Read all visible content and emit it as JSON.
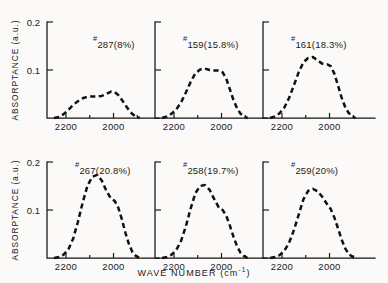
{
  "figure": {
    "background_color": "#fbfaf8",
    "curve_color": "#111111",
    "axis_color": "#141414",
    "axis_titles": {
      "y": "ABSORPTANCE (a.u.)",
      "x_main": "WAVE NUMBER (cm",
      "x_sup": "-1",
      "x_close": ")"
    },
    "y_ticks": [
      "0.2",
      "0.1"
    ],
    "x_ticks": [
      "2200",
      "2000"
    ]
  },
  "chart_data": {
    "type": "line",
    "title": "",
    "xlabel": "WAVE NUMBER (cm^-1)",
    "ylabel": "ABSORPTANCE (a.u.)",
    "xlim": [
      2280,
      1880
    ],
    "ylim": [
      0,
      0.2
    ],
    "x_tick_values": [
      2200,
      2000
    ],
    "y_tick_values": [
      0.1,
      0.2
    ],
    "x_axis_direction": "descending",
    "grid": false,
    "legend": "none",
    "line_style": "dashed",
    "panel_layout": {
      "rows": 2,
      "cols": 3
    },
    "panels": [
      {
        "id": "panel-287",
        "label": "#287(8%)",
        "sample": "287",
        "percent": "8%",
        "peak_absorptance": 0.055,
        "peak_wavenumber": 2000,
        "x": [
          2250,
          2230,
          2210,
          2190,
          2170,
          2150,
          2130,
          2110,
          2090,
          2070,
          2050,
          2030,
          2010,
          1995,
          1980,
          1965,
          1950,
          1935,
          1920,
          1905,
          1890
        ],
        "y": [
          0.0,
          0.002,
          0.008,
          0.017,
          0.027,
          0.035,
          0.041,
          0.044,
          0.045,
          0.045,
          0.046,
          0.05,
          0.055,
          0.054,
          0.048,
          0.038,
          0.027,
          0.016,
          0.008,
          0.003,
          0.0
        ]
      },
      {
        "id": "panel-159",
        "label": "#159(15.8%)",
        "sample": "159",
        "percent": "15.8%",
        "peak_absorptance": 0.103,
        "peak_wavenumber": 2070,
        "x": [
          2250,
          2230,
          2210,
          2190,
          2170,
          2150,
          2130,
          2110,
          2090,
          2070,
          2050,
          2030,
          2010,
          1995,
          1980,
          1965,
          1950,
          1935,
          1920,
          1905,
          1890
        ],
        "y": [
          0.0,
          0.003,
          0.009,
          0.018,
          0.033,
          0.053,
          0.075,
          0.093,
          0.101,
          0.103,
          0.1,
          0.099,
          0.099,
          0.095,
          0.082,
          0.06,
          0.038,
          0.021,
          0.009,
          0.003,
          0.0
        ]
      },
      {
        "id": "panel-161",
        "label": "#161(18.3%)",
        "sample": "161",
        "percent": "18.3%",
        "peak_absorptance": 0.127,
        "peak_wavenumber": 2065,
        "x": [
          2250,
          2230,
          2210,
          2190,
          2170,
          2150,
          2130,
          2110,
          2090,
          2070,
          2050,
          2030,
          2010,
          1995,
          1980,
          1965,
          1950,
          1935,
          1920,
          1905,
          1890
        ],
        "y": [
          0.0,
          0.003,
          0.01,
          0.022,
          0.042,
          0.068,
          0.095,
          0.116,
          0.125,
          0.127,
          0.12,
          0.113,
          0.112,
          0.108,
          0.093,
          0.069,
          0.044,
          0.024,
          0.011,
          0.004,
          0.0
        ]
      },
      {
        "id": "panel-267",
        "label": "#267(20.8%)",
        "sample": "267",
        "percent": "20.8%",
        "peak_absorptance": 0.173,
        "peak_wavenumber": 2065,
        "x": [
          2250,
          2230,
          2210,
          2190,
          2170,
          2150,
          2130,
          2110,
          2090,
          2070,
          2050,
          2030,
          2010,
          1995,
          1980,
          1965,
          1950,
          1935,
          1920,
          1905,
          1890
        ],
        "y": [
          0.0,
          0.002,
          0.007,
          0.018,
          0.04,
          0.075,
          0.115,
          0.15,
          0.169,
          0.173,
          0.162,
          0.14,
          0.123,
          0.119,
          0.105,
          0.081,
          0.053,
          0.029,
          0.012,
          0.004,
          0.0
        ]
      },
      {
        "id": "panel-258",
        "label": "#258(19.7%)",
        "sample": "258",
        "percent": "19.7%",
        "peak_absorptance": 0.152,
        "peak_wavenumber": 2065,
        "x": [
          2250,
          2230,
          2210,
          2190,
          2170,
          2150,
          2130,
          2110,
          2090,
          2070,
          2050,
          2030,
          2010,
          1995,
          1980,
          1965,
          1950,
          1935,
          1920,
          1905,
          1890
        ],
        "y": [
          0.0,
          0.002,
          0.007,
          0.017,
          0.036,
          0.066,
          0.103,
          0.135,
          0.15,
          0.152,
          0.142,
          0.122,
          0.104,
          0.1,
          0.088,
          0.068,
          0.045,
          0.025,
          0.011,
          0.004,
          0.0
        ]
      },
      {
        "id": "panel-259",
        "label": "#259(20%)",
        "sample": "259",
        "percent": "20%",
        "peak_absorptance": 0.144,
        "peak_wavenumber": 2060,
        "x": [
          2250,
          2230,
          2210,
          2190,
          2170,
          2150,
          2130,
          2110,
          2090,
          2070,
          2050,
          2030,
          2010,
          1995,
          1980,
          1965,
          1950,
          1935,
          1920,
          1905,
          1890
        ],
        "y": [
          0.0,
          0.002,
          0.006,
          0.015,
          0.032,
          0.058,
          0.09,
          0.122,
          0.14,
          0.144,
          0.139,
          0.127,
          0.112,
          0.102,
          0.085,
          0.063,
          0.04,
          0.021,
          0.009,
          0.003,
          0.0
        ]
      }
    ]
  }
}
